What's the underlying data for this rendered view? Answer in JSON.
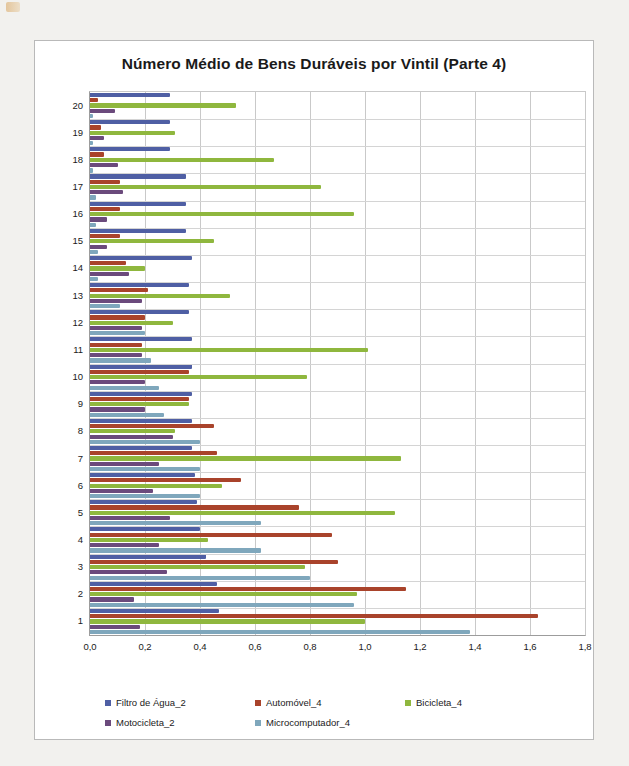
{
  "chart_data": {
    "type": "bar",
    "orientation": "horizontal",
    "title": "Número Médio de Bens Duráveis por Vintil (Parte 4)",
    "xlabel": "",
    "ylabel": "",
    "xlim": [
      0,
      1.8
    ],
    "xticks": [
      0,
      0.2,
      0.4,
      0.6,
      0.8,
      1.0,
      1.2,
      1.4,
      1.6,
      1.8
    ],
    "xtick_labels": [
      "0,0",
      "0,2",
      "0,4",
      "0,6",
      "0,8",
      "1,0",
      "1,2",
      "1,4",
      "1,6",
      "1,8"
    ],
    "grid": true,
    "legend_position": "bottom",
    "decimal_separator": ",",
    "categories": [
      "1",
      "2",
      "3",
      "4",
      "5",
      "6",
      "7",
      "8",
      "9",
      "10",
      "11",
      "12",
      "13",
      "14",
      "15",
      "16",
      "17",
      "18",
      "19",
      "20"
    ],
    "series": [
      {
        "name": "Filtro de Água_2",
        "color": "#4F5FA4",
        "values": [
          0.47,
          0.46,
          0.42,
          0.4,
          0.39,
          0.38,
          0.37,
          0.37,
          0.37,
          0.37,
          0.37,
          0.36,
          0.36,
          0.37,
          0.35,
          0.35,
          0.35,
          0.29,
          0.29,
          0.29
        ]
      },
      {
        "name": "Automóvel_4",
        "color": "#A9432B",
        "values": [
          1.63,
          1.15,
          0.9,
          0.88,
          0.76,
          0.55,
          0.46,
          0.45,
          0.36,
          0.36,
          0.19,
          0.2,
          0.21,
          0.13,
          0.11,
          0.11,
          0.11,
          0.05,
          0.04,
          0.03
        ]
      },
      {
        "name": "Bicicleta_4",
        "color": "#8FB73E",
        "values": [
          1.0,
          0.97,
          0.78,
          0.43,
          1.11,
          0.48,
          1.13,
          0.31,
          0.36,
          0.79,
          1.01,
          0.3,
          0.51,
          0.2,
          0.45,
          0.96,
          0.84,
          0.67,
          0.31,
          0.53
        ]
      },
      {
        "name": "Motocicleta_2",
        "color": "#6B4A7C",
        "values": [
          0.18,
          0.16,
          0.28,
          0.25,
          0.29,
          0.23,
          0.25,
          0.3,
          0.2,
          0.2,
          0.19,
          0.19,
          0.19,
          0.14,
          0.06,
          0.06,
          0.12,
          0.1,
          0.05,
          0.09
        ]
      },
      {
        "name": "Microcomputador_4",
        "color": "#7FA7BC",
        "values": [
          1.38,
          0.96,
          0.8,
          0.62,
          0.62,
          0.4,
          0.4,
          0.4,
          0.27,
          0.25,
          0.22,
          0.2,
          0.11,
          0.03,
          0.03,
          0.02,
          0.02,
          0.01,
          0.01,
          0.01
        ]
      }
    ]
  },
  "legend": {
    "items": [
      {
        "label": "Filtro de Água_2",
        "color": "#4F5FA4"
      },
      {
        "label": "Automóvel_4",
        "color": "#A9432B"
      },
      {
        "label": "Bicicleta_4",
        "color": "#8FB73E"
      },
      {
        "label": "Motocicleta_2",
        "color": "#6B4A7C"
      },
      {
        "label": "Microcomputador_4",
        "color": "#7FA7BC"
      }
    ]
  }
}
